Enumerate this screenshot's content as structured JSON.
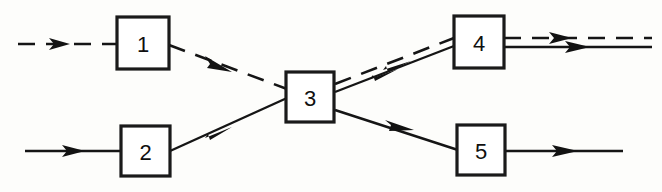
{
  "diagram": {
    "background_color": "#fdfdfb",
    "line_color": "#151515",
    "box_fill_color": "#ffffff",
    "width": 662,
    "height": 192,
    "nodes": [
      {
        "id": "block-1",
        "label": "1",
        "x": 117,
        "y": 17,
        "width": 52,
        "height": 52
      },
      {
        "id": "block-2",
        "label": "2",
        "x": 121,
        "y": 126,
        "width": 49,
        "height": 50
      },
      {
        "id": "block-3",
        "label": "3",
        "x": 286,
        "y": 72,
        "width": 48,
        "height": 50
      },
      {
        "id": "block-4",
        "label": "4",
        "x": 454,
        "y": 16,
        "width": 50,
        "height": 52
      },
      {
        "id": "block-5",
        "label": "5",
        "x": 457,
        "y": 125,
        "width": 48,
        "height": 50
      }
    ],
    "edges": [
      {
        "id": "edge-input-to-1",
        "style": "dashed",
        "from": "input",
        "to": "block-1",
        "arrow": true
      },
      {
        "id": "edge-input-to-2",
        "style": "solid",
        "from": "input",
        "to": "block-2",
        "arrow": true
      },
      {
        "id": "edge-1-to-3",
        "style": "dashed",
        "from": "block-1",
        "to": "block-3",
        "arrow": true
      },
      {
        "id": "edge-2-to-3",
        "style": "solid",
        "from": "block-2",
        "to": "block-3",
        "arrow": true
      },
      {
        "id": "edge-3-to-4-dashed",
        "style": "dashed",
        "from": "block-3",
        "to": "block-4",
        "arrow": true
      },
      {
        "id": "edge-3-to-4-solid",
        "style": "solid",
        "from": "block-3",
        "to": "block-4",
        "arrow": true
      },
      {
        "id": "edge-3-to-5",
        "style": "solid",
        "from": "block-3",
        "to": "block-5",
        "arrow": true
      },
      {
        "id": "edge-4-to-output-dashed",
        "style": "dashed",
        "from": "block-4",
        "to": "output",
        "arrow": true
      },
      {
        "id": "edge-4-to-output-solid",
        "style": "solid",
        "from": "block-4",
        "to": "output",
        "arrow": true
      },
      {
        "id": "edge-5-to-output",
        "style": "solid",
        "from": "block-5",
        "to": "output",
        "arrow": true
      }
    ]
  }
}
